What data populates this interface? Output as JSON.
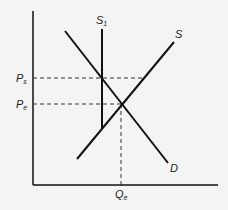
{
  "diagram": {
    "type": "supply-demand",
    "colors": {
      "background": "#f4f4f4",
      "line": "#111111",
      "dashed": "#333333"
    },
    "axes": {
      "origin": [
        33,
        185
      ],
      "y_top": 11,
      "x_right": 218
    },
    "curves": {
      "demand": {
        "label": "D",
        "from": [
          65,
          31
        ],
        "to": [
          168,
          163
        ]
      },
      "supply": {
        "label": "S",
        "from": [
          77,
          159
        ],
        "to": [
          174,
          42
        ]
      },
      "supply_1": {
        "label": "S",
        "subscript": "1",
        "x": 102,
        "y_top": 29,
        "y_bottom": 128
      }
    },
    "price_levels": [
      {
        "label": "P",
        "subscript": "s",
        "y": 78,
        "x_end": 144
      },
      {
        "label": "P",
        "subscript": "e",
        "y": 104,
        "x_end": 122
      }
    ],
    "quantity_levels": [
      {
        "label": "Q",
        "subscript": "e",
        "x": 121,
        "y_top": 104
      }
    ]
  }
}
